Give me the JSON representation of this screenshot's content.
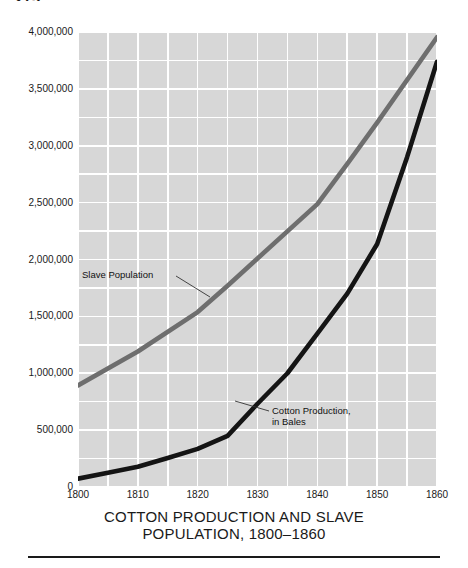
{
  "page": {
    "folio": "275",
    "caption_line1": "COTTON PRODUCTION AND SLAVE",
    "caption_line2": "POPULATION, 1800–1860"
  },
  "annotations": {
    "slave": "Slave Population",
    "cotton_line1": "Cotton Production,",
    "cotton_line2": "in Bales"
  },
  "colors": {
    "plot_background": "#d7d7d7",
    "gridline": "#ffffff",
    "slave_line": "#6e6e6e",
    "cotton_line": "#141414",
    "text": "#1a1a1a",
    "page_background": "#ffffff"
  },
  "chart_data": {
    "type": "line",
    "title": "COTTON PRODUCTION AND SLAVE POPULATION, 1800–1860",
    "xlabel": "",
    "ylabel": "",
    "xlim": [
      1800,
      1860
    ],
    "ylim": [
      0,
      4000000
    ],
    "grid": true,
    "grid_x_step": 5,
    "grid_y_step": 250000,
    "legend": "inline annotations",
    "xticks": [
      1800,
      1810,
      1820,
      1830,
      1840,
      1850,
      1860
    ],
    "xtick_labels": [
      "1800",
      "1810",
      "1820",
      "1830",
      "1840",
      "1850",
      "1860"
    ],
    "yticks": [
      0,
      500000,
      1000000,
      1500000,
      2000000,
      2500000,
      3000000,
      3500000,
      4000000
    ],
    "ytick_labels": [
      "0",
      "500,000",
      "1,000,000",
      "1,500,000",
      "2,000,000",
      "2,500,000",
      "3,000,000",
      "3,500,000",
      "4,000,000"
    ],
    "x": [
      1800,
      1810,
      1820,
      1830,
      1840,
      1850,
      1860
    ],
    "series": [
      {
        "name": "Slave Population",
        "color": "#6e6e6e",
        "values": [
          893000,
          1191000,
          1538000,
          2009000,
          2487000,
          3204000,
          3954000
        ]
      },
      {
        "name": "Cotton Production, in Bales",
        "color": "#141414",
        "values": [
          73000,
          178000,
          335000,
          732000,
          1348000,
          2136000,
          3738000
        ]
      }
    ],
    "extra_points": {
      "Slave Population": [
        {
          "x": 1825,
          "y": 1770000
        },
        {
          "x": 1845,
          "y": 2840000
        }
      ],
      "Cotton Production, in Bales": [
        {
          "x": 1805,
          "y": 125000
        },
        {
          "x": 1815,
          "y": 255000
        },
        {
          "x": 1825,
          "y": 450000
        },
        {
          "x": 1835,
          "y": 1000000
        },
        {
          "x": 1845,
          "y": 1700000
        },
        {
          "x": 1855,
          "y": 2900000
        }
      ]
    }
  }
}
